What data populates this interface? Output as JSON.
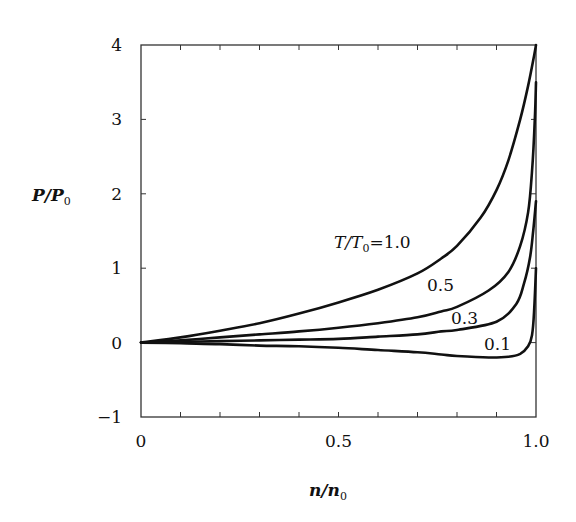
{
  "chart_data": {
    "type": "line",
    "title": "",
    "xlabel": "n/n0",
    "ylabel": "P/P0",
    "xlim": [
      0,
      1.0
    ],
    "ylim": [
      -1,
      4
    ],
    "grid": false,
    "x_ticks": [
      0,
      0.5,
      1.0
    ],
    "x_tick_labels": [
      "0",
      "0.5",
      "1.0"
    ],
    "x_minor_ticks": [
      0.1,
      0.2,
      0.3,
      0.4,
      0.5,
      0.6,
      0.7,
      0.8,
      0.9
    ],
    "y_ticks": [
      -1,
      0,
      1,
      2,
      3,
      4
    ],
    "y_tick_labels": [
      "−1",
      "0",
      "1",
      "2",
      "3",
      "4"
    ],
    "series": [
      {
        "name": "T/T0 = 1.0",
        "label": "T/T₀ = 1.0",
        "x": [
          0,
          0.1,
          0.2,
          0.3,
          0.4,
          0.5,
          0.6,
          0.7,
          0.76,
          0.8,
          0.86,
          0.9,
          0.93,
          0.96,
          0.98,
          0.995,
          1.0
        ],
        "y": [
          0,
          0.07,
          0.16,
          0.26,
          0.39,
          0.54,
          0.71,
          0.93,
          1.13,
          1.3,
          1.68,
          2.05,
          2.45,
          3.0,
          3.45,
          3.85,
          4.0
        ]
      },
      {
        "name": "T/T0 = 0.5",
        "label": "0.5",
        "x": [
          0,
          0.1,
          0.2,
          0.3,
          0.4,
          0.5,
          0.6,
          0.7,
          0.76,
          0.8,
          0.88,
          0.93,
          0.96,
          0.98,
          0.99,
          0.997,
          1.0
        ],
        "y": [
          0,
          0.03,
          0.07,
          0.11,
          0.15,
          0.2,
          0.26,
          0.34,
          0.42,
          0.48,
          0.7,
          0.95,
          1.3,
          1.75,
          2.3,
          3.0,
          3.5
        ]
      },
      {
        "name": "T/T0 = 0.3",
        "label": "0.3",
        "x": [
          0,
          0.1,
          0.2,
          0.3,
          0.4,
          0.5,
          0.6,
          0.7,
          0.76,
          0.8,
          0.9,
          0.95,
          0.97,
          0.985,
          0.993,
          1.0
        ],
        "y": [
          0,
          0.01,
          0.02,
          0.03,
          0.04,
          0.05,
          0.08,
          0.11,
          0.15,
          0.17,
          0.28,
          0.52,
          0.8,
          1.15,
          1.5,
          1.9
        ]
      },
      {
        "name": "T/T0 = 0.1",
        "label": "0.1",
        "x": [
          0,
          0.1,
          0.2,
          0.3,
          0.4,
          0.5,
          0.6,
          0.7,
          0.76,
          0.8,
          0.88,
          0.93,
          0.96,
          0.98,
          0.99,
          0.995,
          1.0
        ],
        "y": [
          0,
          -0.01,
          -0.02,
          -0.04,
          -0.05,
          -0.07,
          -0.1,
          -0.13,
          -0.16,
          -0.18,
          -0.2,
          -0.19,
          -0.15,
          -0.05,
          0.1,
          0.4,
          1.0
        ]
      }
    ],
    "annotations": [
      {
        "text": "T/T₀ = 1.0",
        "series": "T/T0 = 1.0",
        "x": 0.49,
        "y": 1.0
      },
      {
        "text": "0.5",
        "series": "T/T0 = 0.5",
        "x": 0.73,
        "y": 0.72
      },
      {
        "text": "0.3",
        "series": "T/T0 = 0.3",
        "x": 0.77,
        "y": 0.28
      },
      {
        "text": "0.1",
        "series": "T/T0 = 0.1",
        "x": 0.87,
        "y": -0.05
      }
    ]
  },
  "labels": {
    "ylabel_main": "P/P",
    "ylabel_sub": "0",
    "xlabel_main": "n/n",
    "xlabel_sub": "0",
    "curve_1_main": "T/T",
    "curve_1_sub": "0",
    "curve_1_val": "=1.0",
    "curve_2": "0.5",
    "curve_3": "0.3",
    "curve_4": "0.1"
  },
  "colors": {
    "line": "#111111",
    "axis": "#333333",
    "background": "#ffffff"
  }
}
